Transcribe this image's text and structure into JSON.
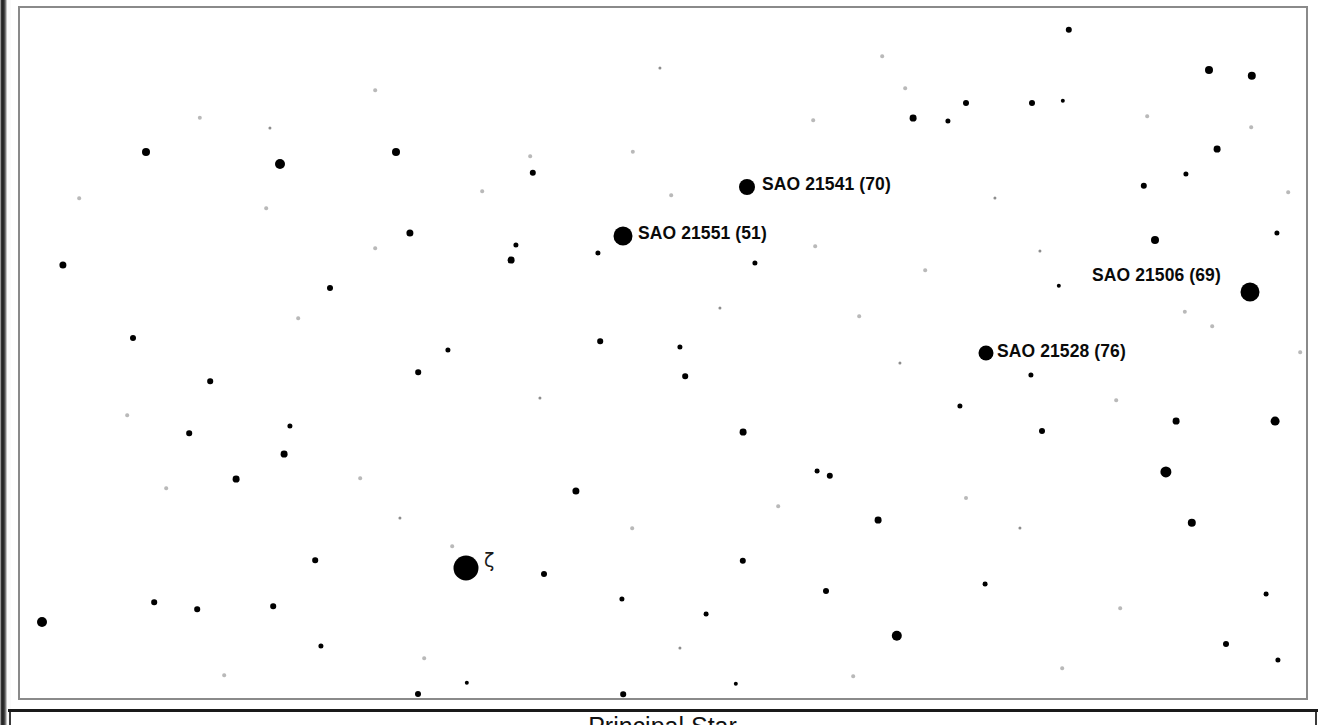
{
  "page": {
    "width": 1325,
    "height": 725,
    "background_color": "#ffffff",
    "ink_color": "#000000",
    "frame_color": "#8a8a8a"
  },
  "caption": {
    "text": "Principal Star",
    "note": "clipped at bottom edge of image"
  },
  "chart_data": {
    "type": "scatter",
    "title": "",
    "xlabel": "",
    "ylabel": "",
    "xlim": [
      0,
      1286
    ],
    "ylim": [
      0,
      690
    ],
    "grid": false,
    "legend": null,
    "labeled_stars": [
      {
        "label": "SAO 21541 (70)",
        "catalog": "SAO 21541",
        "number": "70",
        "x": 727,
        "y": 179,
        "r": 8,
        "label_x": 742,
        "label_y": 176
      },
      {
        "label": "SAO 21551 (51)",
        "catalog": "SAO 21551",
        "number": "51",
        "x": 603,
        "y": 228,
        "r": 9.5,
        "label_x": 618,
        "label_y": 225
      },
      {
        "label": "SAO 21506 (69)",
        "catalog": "SAO 21506",
        "number": "69",
        "x": 1230,
        "y": 284,
        "r": 9.5,
        "label_x": 1072,
        "label_y": 267
      },
      {
        "label": "SAO 21528 (76)",
        "catalog": "SAO 21528",
        "number": "76",
        "x": 966,
        "y": 345,
        "r": 7.5,
        "label_x": 977,
        "label_y": 343
      }
    ],
    "greek_labeled_stars": [
      {
        "label": "ζ",
        "name": "zeta",
        "x": 446,
        "y": 560,
        "r": 12.5,
        "label_x": 464,
        "label_y": 552
      }
    ],
    "field_stars": [
      {
        "x": 126,
        "y": 144,
        "r": 4.0,
        "class": "star"
      },
      {
        "x": 260,
        "y": 156,
        "r": 5.0,
        "class": "star"
      },
      {
        "x": 376,
        "y": 144,
        "r": 4.0,
        "class": "star"
      },
      {
        "x": 513,
        "y": 165,
        "r": 3.2,
        "class": "star"
      },
      {
        "x": 390,
        "y": 225,
        "r": 3.6,
        "class": "star"
      },
      {
        "x": 491,
        "y": 252,
        "r": 3.4,
        "class": "star"
      },
      {
        "x": 496,
        "y": 237,
        "r": 2.6,
        "class": "star"
      },
      {
        "x": 578,
        "y": 245,
        "r": 2.6,
        "class": "star"
      },
      {
        "x": 735,
        "y": 255,
        "r": 2.6,
        "class": "star"
      },
      {
        "x": 893,
        "y": 110,
        "r": 3.4,
        "class": "star"
      },
      {
        "x": 1012,
        "y": 95,
        "r": 3.0,
        "class": "star"
      },
      {
        "x": 1049,
        "y": 22,
        "r": 3.2,
        "class": "star"
      },
      {
        "x": 928,
        "y": 113,
        "r": 2.6,
        "class": "star"
      },
      {
        "x": 946,
        "y": 95,
        "r": 3.0,
        "class": "star"
      },
      {
        "x": 1043,
        "y": 93,
        "r": 2.2,
        "class": "star"
      },
      {
        "x": 1124,
        "y": 178,
        "r": 3.2,
        "class": "star"
      },
      {
        "x": 1166,
        "y": 166,
        "r": 2.6,
        "class": "star"
      },
      {
        "x": 1189,
        "y": 62,
        "r": 4.0,
        "class": "star"
      },
      {
        "x": 1232,
        "y": 68,
        "r": 4.2,
        "class": "star"
      },
      {
        "x": 1197,
        "y": 141,
        "r": 3.4,
        "class": "star"
      },
      {
        "x": 1135,
        "y": 232,
        "r": 4.0,
        "class": "star"
      },
      {
        "x": 1257,
        "y": 225,
        "r": 2.6,
        "class": "star"
      },
      {
        "x": 1039,
        "y": 278,
        "r": 2.2,
        "class": "star"
      },
      {
        "x": 43,
        "y": 257,
        "r": 3.6,
        "class": "star"
      },
      {
        "x": 310,
        "y": 280,
        "r": 3.0,
        "class": "star"
      },
      {
        "x": 113,
        "y": 330,
        "r": 3.0,
        "class": "star"
      },
      {
        "x": 190,
        "y": 373,
        "r": 2.8,
        "class": "star"
      },
      {
        "x": 398,
        "y": 364,
        "r": 2.8,
        "class": "star"
      },
      {
        "x": 428,
        "y": 342,
        "r": 2.6,
        "class": "star"
      },
      {
        "x": 580,
        "y": 333,
        "r": 2.8,
        "class": "star"
      },
      {
        "x": 660,
        "y": 339,
        "r": 2.6,
        "class": "star"
      },
      {
        "x": 665,
        "y": 368,
        "r": 2.8,
        "class": "star"
      },
      {
        "x": 169,
        "y": 425,
        "r": 2.8,
        "class": "star"
      },
      {
        "x": 264,
        "y": 446,
        "r": 3.4,
        "class": "star"
      },
      {
        "x": 216,
        "y": 471,
        "r": 3.4,
        "class": "star"
      },
      {
        "x": 270,
        "y": 418,
        "r": 2.6,
        "class": "star"
      },
      {
        "x": 556,
        "y": 483,
        "r": 3.6,
        "class": "star"
      },
      {
        "x": 723,
        "y": 424,
        "r": 3.4,
        "class": "star"
      },
      {
        "x": 810,
        "y": 468,
        "r": 3.2,
        "class": "star"
      },
      {
        "x": 797,
        "y": 463,
        "r": 2.4,
        "class": "star"
      },
      {
        "x": 858,
        "y": 512,
        "r": 3.4,
        "class": "star"
      },
      {
        "x": 1022,
        "y": 423,
        "r": 3.0,
        "class": "star"
      },
      {
        "x": 1156,
        "y": 413,
        "r": 3.4,
        "class": "star"
      },
      {
        "x": 1255,
        "y": 413,
        "r": 4.4,
        "class": "star"
      },
      {
        "x": 1146,
        "y": 464,
        "r": 5.6,
        "class": "star"
      },
      {
        "x": 1172,
        "y": 515,
        "r": 4.2,
        "class": "star"
      },
      {
        "x": 1011,
        "y": 367,
        "r": 2.6,
        "class": "star"
      },
      {
        "x": 940,
        "y": 398,
        "r": 2.6,
        "class": "star"
      },
      {
        "x": 524,
        "y": 566,
        "r": 3.0,
        "class": "star"
      },
      {
        "x": 602,
        "y": 591,
        "r": 2.6,
        "class": "star"
      },
      {
        "x": 723,
        "y": 553,
        "r": 3.2,
        "class": "star"
      },
      {
        "x": 806,
        "y": 583,
        "r": 3.0,
        "class": "star"
      },
      {
        "x": 877,
        "y": 628,
        "r": 5.2,
        "class": "star"
      },
      {
        "x": 22,
        "y": 614,
        "r": 5.0,
        "class": "star"
      },
      {
        "x": 134,
        "y": 594,
        "r": 2.8,
        "class": "star"
      },
      {
        "x": 177,
        "y": 601,
        "r": 2.8,
        "class": "star"
      },
      {
        "x": 253,
        "y": 598,
        "r": 2.8,
        "class": "star"
      },
      {
        "x": 295,
        "y": 552,
        "r": 2.8,
        "class": "star"
      },
      {
        "x": 301,
        "y": 638,
        "r": 2.6,
        "class": "star"
      },
      {
        "x": 1206,
        "y": 636,
        "r": 3.0,
        "class": "star"
      },
      {
        "x": 1258,
        "y": 652,
        "r": 2.6,
        "class": "star"
      },
      {
        "x": 1246,
        "y": 586,
        "r": 2.4,
        "class": "star"
      },
      {
        "x": 686,
        "y": 606,
        "r": 2.4,
        "class": "star"
      },
      {
        "x": 965,
        "y": 576,
        "r": 2.4,
        "class": "star"
      },
      {
        "x": 398,
        "y": 686,
        "r": 3.0,
        "class": "star"
      },
      {
        "x": 603,
        "y": 686,
        "r": 2.8,
        "class": "star"
      },
      {
        "x": 447,
        "y": 675,
        "r": 2.2,
        "class": "star"
      },
      {
        "x": 716,
        "y": 676,
        "r": 2.2,
        "class": "star"
      },
      {
        "x": 180,
        "y": 110,
        "r": 2.2,
        "class": "faint"
      },
      {
        "x": 355,
        "y": 82,
        "r": 1.8,
        "class": "faint"
      },
      {
        "x": 510,
        "y": 148,
        "r": 1.8,
        "class": "faint"
      },
      {
        "x": 613,
        "y": 144,
        "r": 2.2,
        "class": "faint"
      },
      {
        "x": 793,
        "y": 112,
        "r": 1.8,
        "class": "faint"
      },
      {
        "x": 862,
        "y": 48,
        "r": 1.8,
        "class": "faint"
      },
      {
        "x": 885,
        "y": 80,
        "r": 1.8,
        "class": "faint"
      },
      {
        "x": 1127,
        "y": 108,
        "r": 1.8,
        "class": "faint"
      },
      {
        "x": 1231,
        "y": 119,
        "r": 1.8,
        "class": "faint"
      },
      {
        "x": 1268,
        "y": 184,
        "r": 1.8,
        "class": "faint"
      },
      {
        "x": 1165,
        "y": 304,
        "r": 2.2,
        "class": "faint"
      },
      {
        "x": 1192,
        "y": 318,
        "r": 1.8,
        "class": "faint"
      },
      {
        "x": 59,
        "y": 190,
        "r": 1.8,
        "class": "faint"
      },
      {
        "x": 246,
        "y": 200,
        "r": 1.8,
        "class": "faint"
      },
      {
        "x": 278,
        "y": 310,
        "r": 1.8,
        "class": "faint"
      },
      {
        "x": 107,
        "y": 407,
        "r": 1.8,
        "class": "faint"
      },
      {
        "x": 146,
        "y": 480,
        "r": 1.8,
        "class": "faint"
      },
      {
        "x": 340,
        "y": 470,
        "r": 1.8,
        "class": "faint"
      },
      {
        "x": 355,
        "y": 240,
        "r": 1.8,
        "class": "faint"
      },
      {
        "x": 462,
        "y": 183,
        "r": 1.8,
        "class": "faint"
      },
      {
        "x": 651,
        "y": 187,
        "r": 1.8,
        "class": "faint"
      },
      {
        "x": 795,
        "y": 238,
        "r": 1.8,
        "class": "faint"
      },
      {
        "x": 839,
        "y": 308,
        "r": 1.8,
        "class": "faint"
      },
      {
        "x": 905,
        "y": 262,
        "r": 1.8,
        "class": "faint"
      },
      {
        "x": 946,
        "y": 490,
        "r": 2.0,
        "class": "faint"
      },
      {
        "x": 1096,
        "y": 392,
        "r": 1.8,
        "class": "faint"
      },
      {
        "x": 1280,
        "y": 344,
        "r": 1.8,
        "class": "faint"
      },
      {
        "x": 432,
        "y": 538,
        "r": 1.8,
        "class": "faint"
      },
      {
        "x": 612,
        "y": 520,
        "r": 1.8,
        "class": "faint"
      },
      {
        "x": 758,
        "y": 498,
        "r": 1.8,
        "class": "faint"
      },
      {
        "x": 204,
        "y": 667,
        "r": 1.8,
        "class": "faint"
      },
      {
        "x": 404,
        "y": 650,
        "r": 1.8,
        "class": "faint"
      },
      {
        "x": 833,
        "y": 668,
        "r": 1.8,
        "class": "faint"
      },
      {
        "x": 1042,
        "y": 660,
        "r": 1.8,
        "class": "faint"
      },
      {
        "x": 1100,
        "y": 600,
        "r": 1.8,
        "class": "faint"
      },
      {
        "x": 250,
        "y": 120,
        "r": 1.6,
        "class": "dim"
      },
      {
        "x": 640,
        "y": 60,
        "r": 1.6,
        "class": "dim"
      },
      {
        "x": 975,
        "y": 190,
        "r": 1.6,
        "class": "dim"
      },
      {
        "x": 1020,
        "y": 243,
        "r": 1.6,
        "class": "dim"
      },
      {
        "x": 520,
        "y": 390,
        "r": 1.6,
        "class": "dim"
      },
      {
        "x": 700,
        "y": 300,
        "r": 1.6,
        "class": "dim"
      },
      {
        "x": 880,
        "y": 355,
        "r": 1.6,
        "class": "dim"
      },
      {
        "x": 380,
        "y": 510,
        "r": 1.6,
        "class": "dim"
      },
      {
        "x": 1000,
        "y": 520,
        "r": 1.6,
        "class": "dim"
      },
      {
        "x": 660,
        "y": 640,
        "r": 1.6,
        "class": "dim"
      }
    ]
  }
}
